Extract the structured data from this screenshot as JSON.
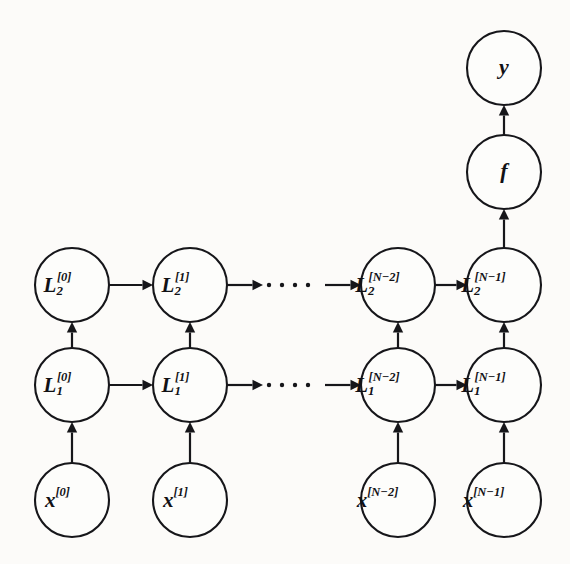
{
  "diagram": {
    "background_color": "#fcfbf9",
    "stroke_color": "#16161a",
    "node_fill": "#fdfdfb",
    "nodes": {
      "input_row": [
        {
          "id": "x-0",
          "base": "x",
          "sub": "",
          "sup": "[0]",
          "cx": 72,
          "cy": 500
        },
        {
          "id": "x-1",
          "base": "x",
          "sub": "",
          "sup": "[1]",
          "cx": 190,
          "cy": 500
        },
        {
          "id": "x-n2",
          "base": "x",
          "sub": "",
          "sup": "[N−2]",
          "cx": 398,
          "cy": 500
        },
        {
          "id": "x-n1",
          "base": "x",
          "sub": "",
          "sup": "[N−1]",
          "cx": 504,
          "cy": 500
        }
      ],
      "layer1_row": [
        {
          "id": "L1-0",
          "base": "L",
          "sub": "1",
          "sup": "[0]",
          "cx": 72,
          "cy": 385
        },
        {
          "id": "L1-1",
          "base": "L",
          "sub": "1",
          "sup": "[1]",
          "cx": 190,
          "cy": 385
        },
        {
          "id": "L1-n2",
          "base": "L",
          "sub": "1",
          "sup": "[N−2]",
          "cx": 398,
          "cy": 385
        },
        {
          "id": "L1-n1",
          "base": "L",
          "sub": "1",
          "sup": "[N−1]",
          "cx": 504,
          "cy": 385
        }
      ],
      "layer2_row": [
        {
          "id": "L2-0",
          "base": "L",
          "sub": "2",
          "sup": "[0]",
          "cx": 72,
          "cy": 285
        },
        {
          "id": "L2-1",
          "base": "L",
          "sub": "2",
          "sup": "[1]",
          "cx": 190,
          "cy": 285
        },
        {
          "id": "L2-n2",
          "base": "L",
          "sub": "2",
          "sup": "[N−2]",
          "cx": 398,
          "cy": 285
        },
        {
          "id": "L2-n1",
          "base": "L",
          "sub": "2",
          "sup": "[N−1]",
          "cx": 504,
          "cy": 285
        }
      ],
      "head": [
        {
          "id": "f-node",
          "base": "f",
          "sub": "",
          "sup": "",
          "cx": 504,
          "cy": 172
        },
        {
          "id": "y-node",
          "base": "y",
          "sub": "",
          "sup": "",
          "cx": 504,
          "cy": 68
        }
      ]
    },
    "node_radius": 37,
    "ellipsis": {
      "dot_count": 5,
      "dot_radius": 2.2,
      "rows": [
        285,
        385
      ],
      "x_start": 256,
      "x_spacing": 13
    }
  }
}
